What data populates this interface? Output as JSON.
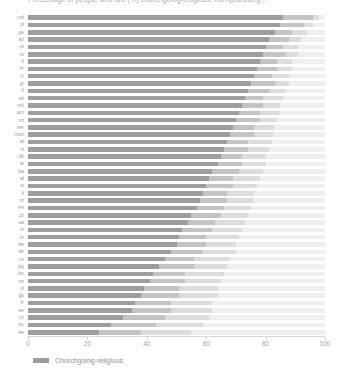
{
  "chart_data": {
    "type": "bar",
    "orientation": "horizontal",
    "stacked": true,
    "title": "Percentage of people who are (%) churchgoing-religious, non-practising ...",
    "xlabel": "",
    "ylabel": "",
    "xlim": [
      0,
      100
    ],
    "xticks": [
      0,
      20,
      40,
      60,
      80,
      100
    ],
    "grid": false,
    "legend_position": "bottom-left",
    "legend": [
      "Churchgoing-religious"
    ],
    "colors": {
      "churchgoing": "#9d9d9d",
      "non_practising": "#c3c3c3",
      "other": "#dcdcdc",
      "none": "#efefef",
      "axis": "#d8d8d8",
      "text": "#9b9b9b"
    },
    "series": [
      {
        "name": "Churchgoing-religious",
        "color": "#9d9d9d"
      },
      {
        "name": "Non-practising",
        "color": "#c3c3c3"
      },
      {
        "name": "Other",
        "color": "#dcdcdc"
      },
      {
        "name": "None",
        "color": "#efefef"
      }
    ],
    "categories": [
      "md",
      "pl",
      "ge",
      "az",
      "pt",
      "ro",
      "lt",
      "hr",
      "tr",
      "gr",
      "it",
      "sk",
      "mk",
      "am",
      "mt",
      "ser",
      "mon",
      "at",
      "is",
      "dk",
      "ie",
      "ba",
      "al",
      "si",
      "fi",
      "nr",
      "es",
      "ch",
      "ua",
      "lv",
      "lu",
      "be",
      "de",
      "ru",
      "bg",
      "hu",
      "no",
      "nl",
      "gb",
      "fr",
      "se",
      "cz",
      "by",
      "ee"
    ],
    "values": [
      [
        86,
        10,
        2,
        2
      ],
      [
        85,
        8,
        3,
        4
      ],
      [
        83,
        6,
        5,
        6
      ],
      [
        81,
        7,
        4,
        8
      ],
      [
        80,
        6,
        5,
        9
      ],
      [
        79,
        8,
        4,
        9
      ],
      [
        78,
        6,
        5,
        11
      ],
      [
        77,
        7,
        5,
        11
      ],
      [
        76,
        6,
        6,
        12
      ],
      [
        75,
        8,
        5,
        12
      ],
      [
        74,
        7,
        6,
        13
      ],
      [
        73,
        6,
        7,
        14
      ],
      [
        72,
        7,
        6,
        15
      ],
      [
        71,
        7,
        7,
        15
      ],
      [
        70,
        8,
        6,
        16
      ],
      [
        69,
        7,
        7,
        17
      ],
      [
        68,
        8,
        7,
        17
      ],
      [
        67,
        7,
        8,
        18
      ],
      [
        66,
        8,
        7,
        19
      ],
      [
        65,
        7,
        8,
        20
      ],
      [
        64,
        8,
        8,
        20
      ],
      [
        62,
        9,
        8,
        21
      ],
      [
        61,
        8,
        9,
        22
      ],
      [
        60,
        9,
        8,
        23
      ],
      [
        59,
        8,
        9,
        24
      ],
      [
        58,
        9,
        9,
        24
      ],
      [
        57,
        9,
        9,
        25
      ],
      [
        55,
        10,
        9,
        26
      ],
      [
        54,
        9,
        10,
        27
      ],
      [
        52,
        10,
        10,
        28
      ],
      [
        51,
        9,
        11,
        29
      ],
      [
        50,
        10,
        10,
        30
      ],
      [
        48,
        11,
        11,
        30
      ],
      [
        46,
        10,
        12,
        32
      ],
      [
        44,
        12,
        11,
        33
      ],
      [
        42,
        11,
        13,
        34
      ],
      [
        41,
        12,
        12,
        35
      ],
      [
        39,
        12,
        13,
        36
      ],
      [
        38,
        13,
        13,
        36
      ],
      [
        36,
        12,
        14,
        38
      ],
      [
        35,
        13,
        14,
        38
      ],
      [
        32,
        14,
        15,
        39
      ],
      [
        28,
        15,
        16,
        41
      ],
      [
        24,
        14,
        17,
        45
      ]
    ]
  }
}
